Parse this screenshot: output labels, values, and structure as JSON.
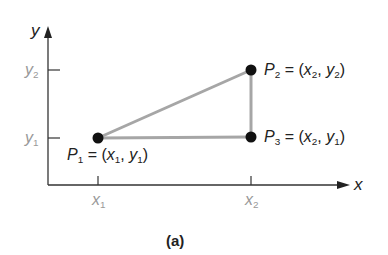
{
  "axes": {
    "x_label": "x",
    "y_label": "y",
    "x_ticks": [
      {
        "base": "x",
        "sub": "1"
      },
      {
        "base": "x",
        "sub": "2"
      }
    ],
    "y_ticks": [
      {
        "base": "y",
        "sub": "2"
      },
      {
        "base": "y",
        "sub": "1"
      }
    ]
  },
  "points": [
    {
      "name": "P",
      "sub": "1",
      "eq": "=",
      "open": "(",
      "xb": "x",
      "xs": "1",
      "comma": ",",
      "yb": "y",
      "ys": "1",
      "close": ")"
    },
    {
      "name": "P",
      "sub": "2",
      "eq": "=",
      "open": "(",
      "xb": "x",
      "xs": "2",
      "comma": ",",
      "yb": "y",
      "ys": "2",
      "close": ")"
    },
    {
      "name": "P",
      "sub": "3",
      "eq": "=",
      "open": "(",
      "xb": "x",
      "xs": "2",
      "comma": ",",
      "yb": "y",
      "ys": "1",
      "close": ")"
    }
  ],
  "caption": "(a)",
  "colors": {
    "axis": "#333333",
    "triangle": "#a6a6a6",
    "point": "#111111",
    "tick_label": "#999999"
  }
}
